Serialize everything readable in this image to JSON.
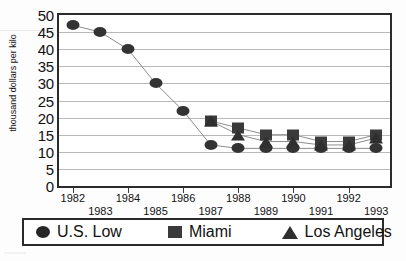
{
  "chart_data": {
    "type": "line",
    "title": "",
    "xlabel": "",
    "ylabel": "thousand dollars per kilo",
    "ylim": [
      0,
      50
    ],
    "ytick_step": 5,
    "grid": true,
    "legend_position": "bottom",
    "categories": [
      "1982",
      "1983",
      "1984",
      "1985",
      "1986",
      "1987",
      "1988",
      "1989",
      "1990",
      "1991",
      "1992",
      "1993"
    ],
    "yticks": [
      "0",
      "5",
      "10",
      "15",
      "20",
      "25",
      "30",
      "35",
      "40",
      "45",
      "50"
    ],
    "xticks_upper": [
      "1982",
      "1984",
      "1986",
      "1988",
      "1990",
      "1992"
    ],
    "xticks_lower": [
      "1983",
      "1985",
      "1987",
      "1989",
      "1991",
      "1993"
    ],
    "series": [
      {
        "name": "U.S. Low",
        "marker": "circle",
        "color": "#333333",
        "values": [
          47,
          45,
          40,
          30,
          22,
          12,
          11,
          11,
          11,
          11,
          11,
          11
        ]
      },
      {
        "name": "Miami",
        "marker": "square",
        "color": "#3a3a3a",
        "values": [
          null,
          null,
          null,
          null,
          null,
          19,
          17,
          15,
          15,
          13,
          13,
          15
        ]
      },
      {
        "name": "Los Angeles",
        "marker": "triangle",
        "color": "#2f2f2f",
        "values": [
          null,
          null,
          null,
          null,
          null,
          19,
          15,
          13,
          13,
          12,
          12,
          14
        ]
      }
    ]
  },
  "legend": {
    "items": [
      {
        "label": "U.S. Low",
        "marker": "circle"
      },
      {
        "label": "Miami",
        "marker": "square"
      },
      {
        "label": "Los Angeles",
        "marker": "triangle"
      }
    ]
  }
}
